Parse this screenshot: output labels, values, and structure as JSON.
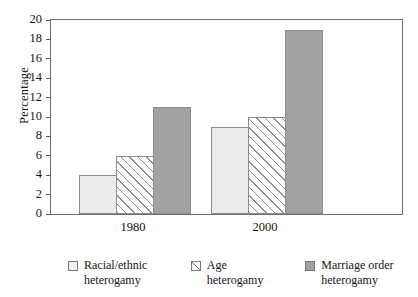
{
  "chart_data": {
    "type": "bar",
    "title": "",
    "subtitle": "",
    "xlabel": "",
    "ylabel": "Percentage",
    "categories": [
      "1980",
      "2000"
    ],
    "series": [
      {
        "name": "Racial/ethnic heterogamy",
        "values": [
          4,
          9
        ],
        "style": "light"
      },
      {
        "name": "Age heterogamy",
        "values": [
          6,
          10
        ],
        "style": "hatch"
      },
      {
        "name": "Marriage order heterogamy",
        "values": [
          11,
          19
        ],
        "style": "dark"
      }
    ],
    "ylim": [
      0,
      20
    ],
    "ytick_step": 2,
    "yticks": [
      0,
      2,
      4,
      6,
      8,
      10,
      12,
      14,
      16,
      18,
      20
    ],
    "grid": false,
    "legend_position": "bottom",
    "colors": {
      "light": "#ebebeb",
      "hatch": "#ffffff",
      "dark": "#a2a2a2",
      "bar_outline": "#8c8c8c",
      "frame": "#6f6f6f",
      "text": "#141414"
    }
  },
  "legend": {
    "items": [
      {
        "label": "Racial/ethnic heterogamy",
        "style": "light"
      },
      {
        "label": "Age heterogamy",
        "style": "hatch"
      },
      {
        "label": "Marriage order heterogamy",
        "style": "dark"
      }
    ]
  }
}
